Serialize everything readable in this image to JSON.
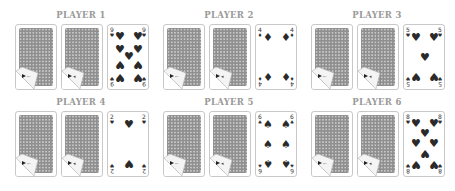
{
  "players": [
    {
      "title": "PLAYER 1",
      "face_card": {
        "rank": "9",
        "suit": "hearts",
        "suit_glyph": "♥"
      },
      "face_down_count": 2
    },
    {
      "title": "PLAYER 2",
      "face_card": {
        "rank": "4",
        "suit": "diamonds",
        "suit_glyph": "♦"
      },
      "face_down_count": 2
    },
    {
      "title": "PLAYER 3",
      "face_card": {
        "rank": "5",
        "suit": "hearts",
        "suit_glyph": "♥"
      },
      "face_down_count": 2
    },
    {
      "title": "PLAYER 4",
      "face_card": {
        "rank": "2",
        "suit": "hearts",
        "suit_glyph": "♥"
      },
      "face_down_count": 2
    },
    {
      "title": "PLAYER 5",
      "face_card": {
        "rank": "6",
        "suit": "spades",
        "suit_glyph": "♠"
      },
      "face_down_count": 2
    },
    {
      "title": "PLAYER 6",
      "face_card": {
        "rank": "8",
        "suit": "hearts",
        "suit_glyph": "♥"
      },
      "face_down_count": 2
    }
  ],
  "colors": {
    "title": "#9a9a9a",
    "card_border": "#c8c8c8",
    "card_back": "#8f8f8f",
    "pip": "#2a2a2a"
  },
  "icons": {
    "card_back": "card-back-pattern-icon",
    "peel_corner": "peeled-corner-icon"
  }
}
